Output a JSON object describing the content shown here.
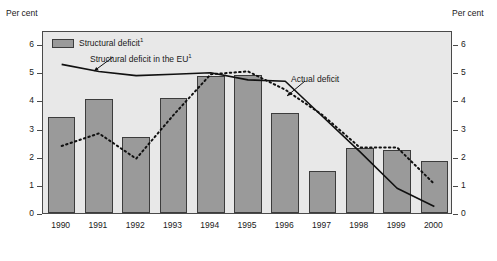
{
  "chart_data": {
    "type": "bar",
    "title": "",
    "xlabel": "",
    "ylabel": "Per cent",
    "ylabel_right": "Per cent",
    "ylim": [
      0,
      6.5
    ],
    "yticks": [
      0,
      1,
      2,
      3,
      4,
      5,
      6
    ],
    "grid": false,
    "legend_position": "top-left",
    "categories": [
      "1990",
      "1991",
      "1992",
      "1993",
      "1994",
      "1995",
      "1996",
      "1997",
      "1998",
      "1999",
      "2000"
    ],
    "series": [
      {
        "name": "Structural deficit",
        "name_sup": "1",
        "render": "bar",
        "color": "#9a9a9a",
        "values": [
          3.4,
          4.05,
          2.7,
          4.1,
          4.85,
          4.9,
          3.55,
          1.5,
          2.3,
          2.25,
          1.85
        ]
      },
      {
        "name": "Structural deficit in the EU",
        "name_sup": "1",
        "render": "solid-line",
        "color": "#111111",
        "values": [
          5.35,
          5.1,
          4.95,
          5.0,
          5.05,
          4.8,
          4.75,
          3.5,
          2.25,
          0.95,
          0.3
        ]
      },
      {
        "name": "Actual deficit",
        "name_sup": "",
        "render": "dashed-line",
        "color": "#111111",
        "values": [
          2.45,
          2.9,
          2.0,
          3.55,
          5.0,
          5.1,
          4.45,
          3.55,
          2.4,
          2.4,
          1.1
        ]
      }
    ],
    "annotations": [
      {
        "text": "Structural deficit in the EU",
        "sup": "1",
        "points_to": "solid-line"
      },
      {
        "text": "Actual deficit",
        "sup": "",
        "points_to": "dashed-line"
      }
    ]
  },
  "axis": {
    "unit_left": "Per cent",
    "unit_right": "Per cent"
  },
  "legend": {
    "bar_label": "Structural deficit",
    "bar_sup": "1",
    "eu_label": "Structural deficit in the EU",
    "eu_sup": "1",
    "actual_label": "Actual deficit"
  }
}
